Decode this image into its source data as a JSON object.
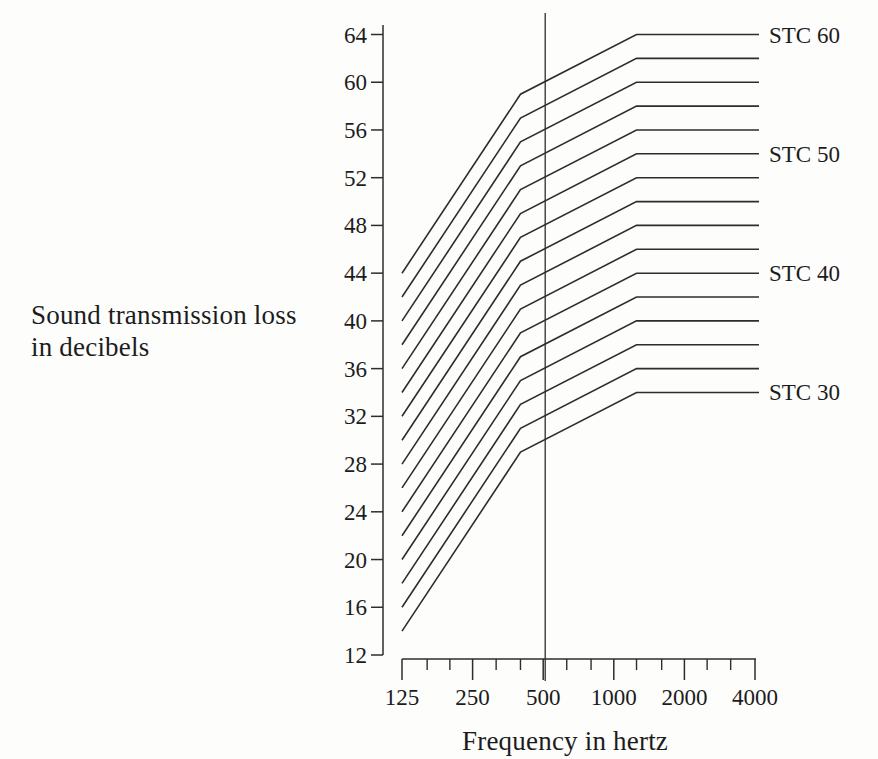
{
  "figure": {
    "y_axis_title_line1": "Sound transmission loss",
    "y_axis_title_line2": "in decibels",
    "x_axis_title": "Frequency in hertz"
  },
  "chart_data": {
    "type": "line",
    "title": "",
    "xlabel": "Frequency in hertz",
    "ylabel": "Sound transmission loss in decibels",
    "x_scale": "log",
    "xlim": [
      125,
      4000
    ],
    "ylim": [
      12,
      64
    ],
    "y_ticks": [
      12,
      16,
      20,
      24,
      28,
      32,
      36,
      40,
      44,
      48,
      52,
      56,
      60,
      64
    ],
    "x_major_ticks": [
      125,
      250,
      500,
      1000,
      2000,
      4000
    ],
    "x_minor_ticks": [
      160,
      200,
      315,
      400,
      630,
      800,
      1250,
      1600,
      2500,
      3150
    ],
    "x_tick_labels": [
      "125",
      "250",
      "500",
      "1000",
      "2000",
      "4000"
    ],
    "reference_line": {
      "axis": "x",
      "value": 500
    },
    "x": [
      125,
      400,
      1250,
      4000
    ],
    "series": [
      {
        "name": "STC 30",
        "stc": 30,
        "values": [
          14,
          29,
          34,
          34
        ],
        "label": "STC 30"
      },
      {
        "name": "STC 32",
        "stc": 32,
        "values": [
          16,
          31,
          36,
          36
        ],
        "label": ""
      },
      {
        "name": "STC 34",
        "stc": 34,
        "values": [
          18,
          33,
          38,
          38
        ],
        "label": ""
      },
      {
        "name": "STC 36",
        "stc": 36,
        "values": [
          20,
          35,
          40,
          40
        ],
        "label": ""
      },
      {
        "name": "STC 38",
        "stc": 38,
        "values": [
          22,
          37,
          42,
          42
        ],
        "label": ""
      },
      {
        "name": "STC 40",
        "stc": 40,
        "values": [
          24,
          39,
          44,
          44
        ],
        "label": "STC 40"
      },
      {
        "name": "STC 42",
        "stc": 42,
        "values": [
          26,
          41,
          46,
          46
        ],
        "label": ""
      },
      {
        "name": "STC 44",
        "stc": 44,
        "values": [
          28,
          43,
          48,
          48
        ],
        "label": ""
      },
      {
        "name": "STC 46",
        "stc": 46,
        "values": [
          30,
          45,
          50,
          50
        ],
        "label": ""
      },
      {
        "name": "STC 48",
        "stc": 48,
        "values": [
          32,
          47,
          52,
          52
        ],
        "label": ""
      },
      {
        "name": "STC 50",
        "stc": 50,
        "values": [
          34,
          49,
          54,
          54
        ],
        "label": "STC 50"
      },
      {
        "name": "STC 52",
        "stc": 52,
        "values": [
          36,
          51,
          56,
          56
        ],
        "label": ""
      },
      {
        "name": "STC 54",
        "stc": 54,
        "values": [
          38,
          53,
          58,
          58
        ],
        "label": ""
      },
      {
        "name": "STC 56",
        "stc": 56,
        "values": [
          40,
          55,
          60,
          60
        ],
        "label": ""
      },
      {
        "name": "STC 58",
        "stc": 58,
        "values": [
          42,
          57,
          62,
          62
        ],
        "label": ""
      },
      {
        "name": "STC 60",
        "stc": 60,
        "values": [
          44,
          59,
          64,
          64
        ],
        "label": "STC 60"
      }
    ],
    "line_color": "#2d2d2d",
    "text_color": "#1c1c1c",
    "legend": "none",
    "grid": "off"
  }
}
